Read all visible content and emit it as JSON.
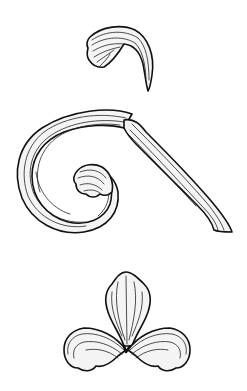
{
  "illustration": {
    "background_color": "#ffffff",
    "ink_color": "#111111",
    "style": "engraved line-art ornament",
    "elements": [
      {
        "id": "top-leaf",
        "label": "curled acanthus leaf"
      },
      {
        "id": "scroll",
        "label": "spiral scroll with fan leaf and tapering tail"
      },
      {
        "id": "fleur",
        "label": "three-lobed fleur ornament"
      }
    ]
  }
}
